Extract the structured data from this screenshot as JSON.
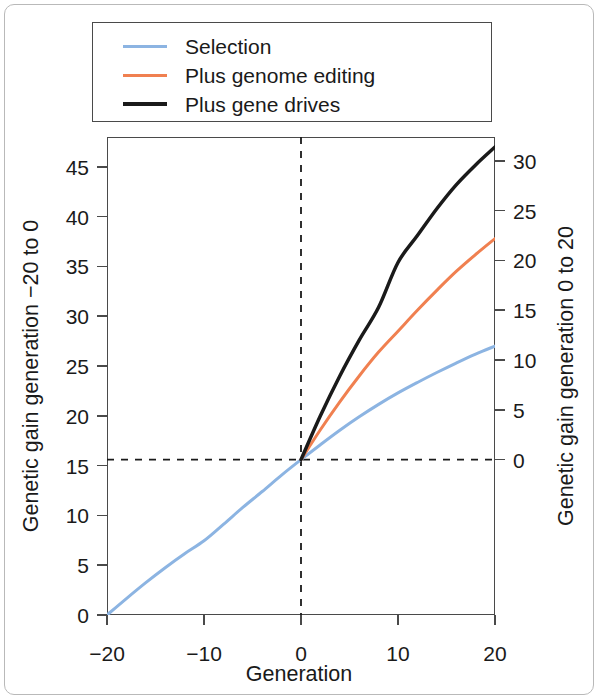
{
  "chart_data": {
    "type": "line",
    "title": "",
    "subtitle": "",
    "xlabel": "Generation",
    "ylabel": "Genetic gain generation −20 to 0",
    "ylabel_right": "Genetic gain generation 0 to 20",
    "xlim": [
      -20,
      20
    ],
    "ylim": [
      0,
      48
    ],
    "ylim_right": [
      -15.6,
      32.4
    ],
    "xticks": [
      -20,
      -10,
      0,
      10,
      20
    ],
    "xticklabels": [
      "−20",
      "−10",
      "0",
      "10",
      "20"
    ],
    "yticks": [
      0,
      5,
      10,
      15,
      20,
      25,
      30,
      35,
      40,
      45
    ],
    "yticklabels": [
      "0",
      "5",
      "10",
      "15",
      "20",
      "25",
      "30",
      "35",
      "40",
      "45"
    ],
    "yticks_right": [
      0,
      5,
      10,
      15,
      20,
      25,
      30
    ],
    "yticklabels_right": [
      "0",
      "5",
      "10",
      "15",
      "20",
      "25",
      "30"
    ],
    "grid": false,
    "legend_position": "above-plot",
    "annotations": [
      {
        "name": "vertical-reference-line",
        "type": "vline",
        "x": 0,
        "style": "dashed",
        "color": "#1a1a1a"
      },
      {
        "name": "horizontal-reference-line",
        "type": "hline",
        "y": 15.6,
        "style": "dashed",
        "color": "#1a1a1a"
      }
    ],
    "series": [
      {
        "name": "Selection",
        "color": "#8cb4e2",
        "width": 3,
        "x": [
          -20,
          -18,
          -16,
          -14,
          -12,
          -10,
          -8,
          -6,
          -4,
          -2,
          0,
          2,
          4,
          6,
          8,
          10,
          12,
          14,
          16,
          18,
          20
        ],
        "values": [
          0.0,
          1.65,
          3.25,
          4.75,
          6.15,
          7.45,
          9.1,
          10.8,
          12.4,
          14.05,
          15.6,
          17.1,
          18.55,
          19.9,
          21.15,
          22.3,
          23.35,
          24.35,
          25.3,
          26.2,
          27.0
        ]
      },
      {
        "name": "Plus genome editing",
        "color": "#f08050",
        "width": 3,
        "x": [
          0,
          2,
          4,
          6,
          8,
          10,
          12,
          14,
          16,
          18,
          20
        ],
        "values": [
          15.6,
          18.6,
          21.4,
          24.0,
          26.4,
          28.5,
          30.6,
          32.6,
          34.5,
          36.2,
          37.8
        ]
      },
      {
        "name": "Plus gene drives",
        "color": "#1a1a1a",
        "width": 3.5,
        "x": [
          0,
          2,
          4,
          6,
          8,
          10,
          12,
          14,
          16,
          18,
          20
        ],
        "values": [
          15.6,
          20.0,
          24.0,
          27.6,
          30.9,
          35.4,
          38.1,
          40.8,
          43.2,
          45.2,
          47.0
        ]
      }
    ]
  },
  "legend": {
    "items": [
      {
        "label": "Selection",
        "color": "#8cb4e2",
        "width": 3
      },
      {
        "label": "Plus genome editing",
        "color": "#f08050",
        "width": 3
      },
      {
        "label": "Plus gene drives",
        "color": "#1a1a1a",
        "width": 4
      }
    ]
  }
}
